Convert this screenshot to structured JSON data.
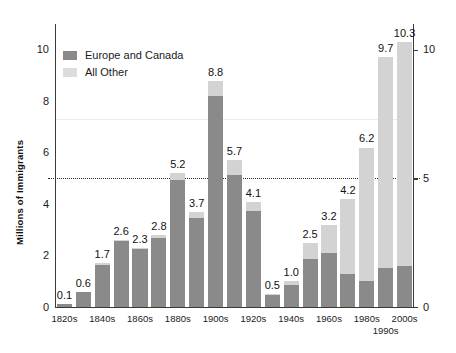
{
  "chart_data": {
    "type": "bar",
    "title": "",
    "subtitle": "",
    "xlabel": "",
    "ylabel": "Millions of Immigrants",
    "ylim": [
      0,
      11
    ],
    "yticks": [
      "0",
      "2",
      "4",
      "6",
      "8",
      "10"
    ],
    "yticks_right": [
      "0",
      "5",
      "10"
    ],
    "grid": false,
    "stacked": true,
    "legend_position": "upper-left",
    "reference_line": 5,
    "categories": [
      "1820s",
      "1830s",
      "1840s",
      "1850s",
      "1860s",
      "1870s",
      "1880s",
      "1890s",
      "1900s",
      "1910s",
      "1920s",
      "1930s",
      "1940s",
      "1950s",
      "1960s",
      "1970s",
      "1980s",
      "1990s",
      "2000s"
    ],
    "totals": [
      0.1,
      0.6,
      1.7,
      2.6,
      2.3,
      2.8,
      5.2,
      3.7,
      8.8,
      5.7,
      4.1,
      0.5,
      1.0,
      2.5,
      3.2,
      4.2,
      6.2,
      9.7,
      10.3
    ],
    "series": [
      {
        "name": "Europe and Canada",
        "color": "#8a8a8a",
        "values": [
          0.1,
          0.6,
          1.65,
          2.55,
          2.25,
          2.7,
          4.95,
          3.45,
          8.2,
          5.15,
          3.75,
          0.45,
          0.85,
          1.85,
          2.1,
          1.3,
          1.0,
          1.5,
          1.6
        ]
      },
      {
        "name": "All Other",
        "color": "#d3d3d3",
        "values": [
          0.0,
          0.0,
          0.05,
          0.05,
          0.05,
          0.1,
          0.25,
          0.25,
          0.6,
          0.55,
          0.35,
          0.05,
          0.15,
          0.65,
          1.1,
          2.9,
          5.2,
          8.2,
          8.7
        ]
      }
    ],
    "bar_labels": [
      "0.1",
      "0.6",
      "1.7",
      "2.6",
      "2.3",
      "2.8",
      "5.2",
      "3.7",
      "8.8",
      "5.7",
      "4.1",
      "0.5",
      "1.0",
      "2.5",
      "3.2",
      "4.2",
      "6.2",
      "9.7",
      "10.3"
    ],
    "xtick_labels_shown": [
      {
        "text": "1820s",
        "index": 0,
        "row": 1
      },
      {
        "text": "1840s",
        "index": 2,
        "row": 1
      },
      {
        "text": "1860s",
        "index": 4,
        "row": 1
      },
      {
        "text": "1880s",
        "index": 6,
        "row": 1
      },
      {
        "text": "1900s",
        "index": 8,
        "row": 1
      },
      {
        "text": "1920s",
        "index": 10,
        "row": 1
      },
      {
        "text": "1940s",
        "index": 12,
        "row": 1
      },
      {
        "text": "1960s",
        "index": 14,
        "row": 1
      },
      {
        "text": "1980s",
        "index": 16,
        "row": 1
      },
      {
        "text": "1990s",
        "index": 17,
        "row": 2
      },
      {
        "text": "2000s",
        "index": 18,
        "row": 1
      }
    ]
  },
  "legend": {
    "items": [
      {
        "label": "Europe and Canada",
        "color": "#8a8a8a"
      },
      {
        "label": "All Other",
        "color": "#dcdcdc"
      }
    ]
  },
  "axis": {
    "y_title": "Millions of Immigrants",
    "left_ticks": [
      "10",
      "8",
      "6",
      "4",
      "2",
      "0"
    ],
    "right_ticks": [
      "10",
      "5",
      "0"
    ]
  }
}
